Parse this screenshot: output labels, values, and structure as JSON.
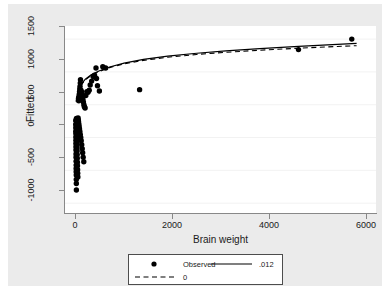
{
  "chart_data": {
    "type": "scatter",
    "title": "",
    "xlabel": "Brain weight",
    "ylabel": "Fitted",
    "xlim": [
      -220,
      6200
    ],
    "ylim": [
      -1150,
      1700
    ],
    "xticks": [
      0,
      2000,
      4000,
      6000
    ],
    "xtick_labels": [
      "0",
      "2000",
      "4000",
      "6000"
    ],
    "yticks": [
      -1000,
      -500,
      0,
      500,
      1000,
      1500
    ],
    "ytick_labels": [
      "-1000",
      "-500",
      "0",
      "500",
      "1000",
      "1500"
    ],
    "grid": "horizontal",
    "legend_position": "below",
    "series": [
      {
        "name": "Observed",
        "type": "scatter",
        "marker": "filled-circle",
        "color": "#000000",
        "points": [
          [
            2,
            260
          ],
          [
            2,
            200
          ],
          [
            3,
            150
          ],
          [
            3,
            95
          ],
          [
            4,
            60
          ],
          [
            4,
            10
          ],
          [
            5,
            -40
          ],
          [
            5,
            -90
          ],
          [
            6,
            -140
          ],
          [
            6,
            -190
          ],
          [
            7,
            -250
          ],
          [
            8,
            -300
          ],
          [
            9,
            -360
          ],
          [
            10,
            -420
          ],
          [
            10,
            -470
          ],
          [
            11,
            -520
          ],
          [
            12,
            -570
          ],
          [
            13,
            -640
          ],
          [
            14,
            -700
          ],
          [
            15,
            -800
          ],
          [
            16,
            290
          ],
          [
            17,
            250
          ],
          [
            18,
            215
          ],
          [
            19,
            175
          ],
          [
            20,
            135
          ],
          [
            21,
            95
          ],
          [
            22,
            50
          ],
          [
            24,
            5
          ],
          [
            25,
            -45
          ],
          [
            26,
            -95
          ],
          [
            28,
            -150
          ],
          [
            30,
            -205
          ],
          [
            32,
            -260
          ],
          [
            34,
            -315
          ],
          [
            36,
            -375
          ],
          [
            38,
            -430
          ],
          [
            40,
            -490
          ],
          [
            43,
            -545
          ],
          [
            46,
            -600
          ],
          [
            50,
            300
          ],
          [
            55,
            270
          ],
          [
            60,
            240
          ],
          [
            66,
            205
          ],
          [
            72,
            170
          ],
          [
            80,
            130
          ],
          [
            88,
            90
          ],
          [
            96,
            45
          ],
          [
            105,
            0
          ],
          [
            115,
            -50
          ],
          [
            125,
            -110
          ],
          [
            135,
            -170
          ],
          [
            145,
            -230
          ],
          [
            155,
            -300
          ],
          [
            168,
            -370
          ],
          [
            60,
            600
          ],
          [
            65,
            560
          ],
          [
            70,
            620
          ],
          [
            75,
            660
          ],
          [
            80,
            700
          ],
          [
            85,
            740
          ],
          [
            90,
            780
          ],
          [
            95,
            830
          ],
          [
            100,
            880
          ],
          [
            110,
            720
          ],
          [
            120,
            700
          ],
          [
            130,
            660
          ],
          [
            140,
            620
          ],
          [
            150,
            580
          ],
          [
            160,
            540
          ],
          [
            170,
            500
          ],
          [
            180,
            470
          ],
          [
            195,
            450
          ],
          [
            210,
            640
          ],
          [
            230,
            700
          ],
          [
            255,
            690
          ],
          [
            280,
            720
          ],
          [
            300,
            800
          ],
          [
            330,
            860
          ],
          [
            360,
            930
          ],
          [
            390,
            950
          ],
          [
            420,
            1060
          ],
          [
            430,
            900
          ],
          [
            450,
            790
          ],
          [
            490,
            710
          ],
          [
            560,
            1080
          ],
          [
            620,
            1060
          ],
          [
            1320,
            730
          ],
          [
            4600,
            1340
          ],
          [
            5700,
            1500
          ]
        ]
      },
      {
        "name": ".012",
        "type": "line",
        "style": "solid",
        "color": "#000000",
        "x": [
          10,
          60,
          120,
          200,
          320,
          480,
          700,
          1000,
          1400,
          1900,
          2500,
          3100,
          3800,
          4600,
          5400,
          5800
        ],
        "y": [
          560,
          730,
          820,
          890,
          955,
          1015,
          1075,
          1135,
          1190,
          1240,
          1285,
          1320,
          1355,
          1390,
          1420,
          1435
        ]
      },
      {
        "name": "0",
        "type": "line",
        "style": "dashed",
        "color": "#000000",
        "x": [
          10,
          60,
          120,
          200,
          320,
          480,
          700,
          1000,
          1400,
          1900,
          2500,
          3100,
          3800,
          4600,
          5400,
          5800
        ],
        "y": [
          540,
          715,
          808,
          880,
          946,
          1006,
          1066,
          1124,
          1176,
          1224,
          1266,
          1299,
          1331,
          1362,
          1388,
          1400
        ]
      }
    ]
  },
  "legend": {
    "entries": [
      {
        "label": "Observed",
        "marker": "filled-circle"
      },
      {
        "label": ".012",
        "marker": "solid-line"
      },
      {
        "label": "0",
        "marker": "dashed-line"
      }
    ]
  },
  "colors": {
    "figure_background": "#ebebeb",
    "plot_background": "#ffffff",
    "axis": "#888888",
    "gridline": "#f2f2f2",
    "text": "#1a1a1a",
    "marker": "#000000",
    "page_background": "#ffffff"
  }
}
